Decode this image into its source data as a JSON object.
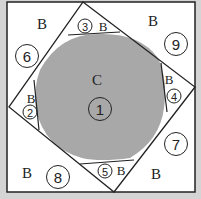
{
  "diagram": {
    "type": "quilt-block-piecing",
    "center_label": "C",
    "background_label": "B",
    "pieces": [
      {
        "num": "1",
        "fabric": "C"
      },
      {
        "num": "2",
        "fabric": "B"
      },
      {
        "num": "3",
        "fabric": "B"
      },
      {
        "num": "4",
        "fabric": "B"
      },
      {
        "num": "5",
        "fabric": "B"
      },
      {
        "num": "6",
        "fabric": "B"
      },
      {
        "num": "7",
        "fabric": "B"
      },
      {
        "num": "8",
        "fabric": "B"
      },
      {
        "num": "9",
        "fabric": "B"
      }
    ],
    "colors": {
      "center": "#a8a8a8",
      "background": "#ffffff",
      "lines": "#222222",
      "page": "#d4d4d4"
    }
  }
}
